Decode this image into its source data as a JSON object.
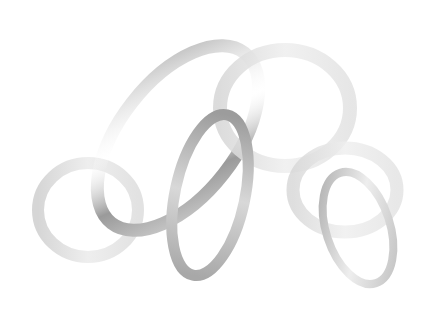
{
  "image": {
    "subject": "abstract gray ribbon loops",
    "background": "#ffffff",
    "colors": {
      "dark_ribbon": "#9a9a9a",
      "mid_ribbon": "#bdbdbd",
      "light_ribbon": "#e4e4e4"
    }
  }
}
